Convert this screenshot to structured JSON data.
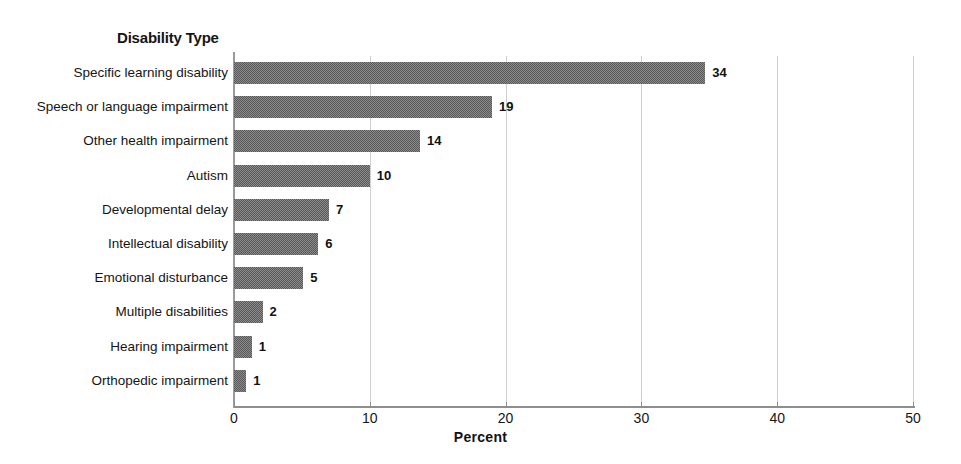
{
  "chart_data": {
    "type": "bar",
    "orientation": "horizontal",
    "title": "Disability Type",
    "xlabel": "Percent",
    "ylabel": "Disability Type",
    "xlim": [
      0,
      50
    ],
    "xticks": [
      0,
      10,
      20,
      30,
      40,
      50
    ],
    "grid": true,
    "legend": false,
    "bar_color": "#595959",
    "categories": [
      "Specific learning disability",
      "Speech or language impairment",
      "Other health impairment",
      "Autism",
      "Developmental delay",
      "Intellectual disability",
      "Emotional disturbance",
      "Multiple disabilities",
      "Hearing impairment",
      "Orthopedic impairment"
    ],
    "values": [
      34,
      19,
      14,
      10,
      7,
      6,
      5,
      2,
      1,
      1
    ],
    "bar_lengths": [
      34.7,
      19.0,
      13.7,
      10.0,
      7.0,
      6.2,
      5.1,
      2.1,
      1.3,
      0.9
    ],
    "data_labels": [
      "34",
      "19",
      "14",
      "10",
      "7",
      "6",
      "5",
      "2",
      "1",
      "1"
    ]
  }
}
